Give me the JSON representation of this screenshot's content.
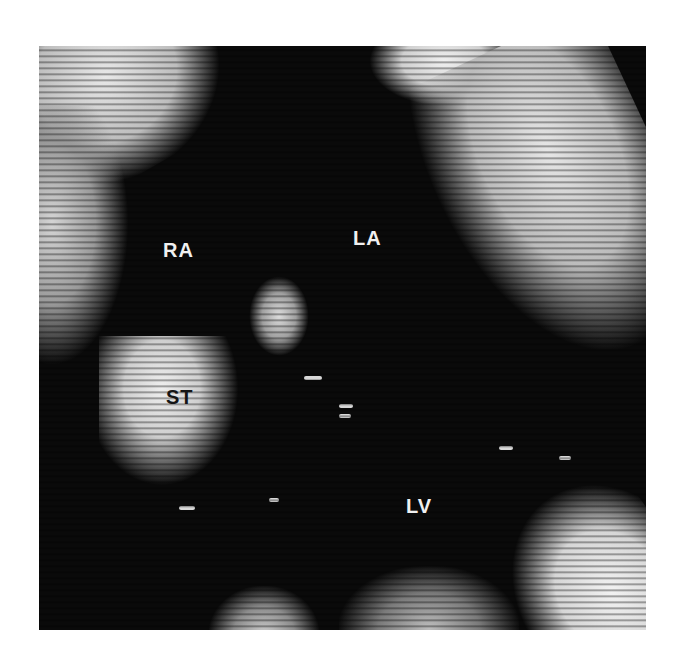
{
  "image": {
    "description": "Echocardiogram (two-dimensional ultrasound) of the heart, black-and-white",
    "labels": [
      {
        "text": "RA",
        "x": 163,
        "y": 240,
        "color": "#f0f0f0"
      },
      {
        "text": "LA",
        "x": 353,
        "y": 228,
        "color": "#f0f0f0"
      },
      {
        "text": "ST",
        "x": 166,
        "y": 387,
        "color": "#151515"
      },
      {
        "text": "LV",
        "x": 406,
        "y": 496,
        "color": "#f0f0f0"
      }
    ],
    "colors": {
      "background": "#ffffff",
      "tissue": "#e6e6e6",
      "cavity": "#0a0a0a"
    }
  }
}
